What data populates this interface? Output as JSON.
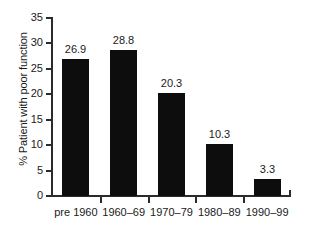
{
  "chart_data": {
    "type": "bar",
    "title": "",
    "xlabel": "",
    "ylabel": "% Patient with poor function",
    "categories": [
      "pre 1960",
      "1960–69",
      "1970–79",
      "1980–89",
      "1990–99"
    ],
    "values": [
      26.9,
      28.8,
      20.3,
      10.3,
      3.3
    ],
    "value_labels": [
      "26.9",
      "28.8",
      "20.3",
      "10.3",
      "3.3"
    ],
    "ylim": [
      0,
      35
    ],
    "ytick_labels": [
      "0",
      "5",
      "10",
      "15",
      "20",
      "25",
      "30",
      "35"
    ],
    "ytick_values": [
      0,
      5,
      10,
      15,
      20,
      25,
      30,
      35
    ],
    "grid": false,
    "legend": false,
    "bar_color": "#0d0d0d",
    "axis_color": "#2b2b2b",
    "background_color": "#ffffff"
  }
}
